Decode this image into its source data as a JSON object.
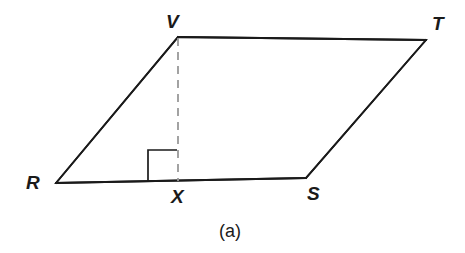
{
  "figure": {
    "caption": "(a)",
    "shape_type": "parallelogram",
    "background_color": "#ffffff",
    "stroke_color": "#1a1a1a",
    "dashed_stroke_color": "#999999",
    "stroke_width": 1.8,
    "dash_pattern": "8 6",
    "vertices": [
      {
        "id": "V",
        "label": "V",
        "x": 178,
        "y": 37
      },
      {
        "id": "T",
        "label": "T",
        "x": 426,
        "y": 40
      },
      {
        "id": "S",
        "label": "S",
        "x": 306,
        "y": 178
      },
      {
        "id": "R",
        "label": "R",
        "x": 56,
        "y": 183
      },
      {
        "id": "X",
        "label": "X",
        "x": 178,
        "y": 180
      }
    ],
    "edges": [
      {
        "id": "RV",
        "from": "R",
        "to": "V",
        "style": "solid"
      },
      {
        "id": "VT",
        "from": "V",
        "to": "T",
        "style": "solid"
      },
      {
        "id": "TS",
        "from": "T",
        "to": "S",
        "style": "solid"
      },
      {
        "id": "SR",
        "from": "S",
        "to": "R",
        "style": "solid"
      },
      {
        "id": "VX",
        "from": "V",
        "to": "X",
        "style": "dashed"
      }
    ],
    "right_angle_marker": {
      "at_vertex": "X",
      "left": 148,
      "top": 150,
      "right": 177,
      "bottom": 181
    }
  }
}
